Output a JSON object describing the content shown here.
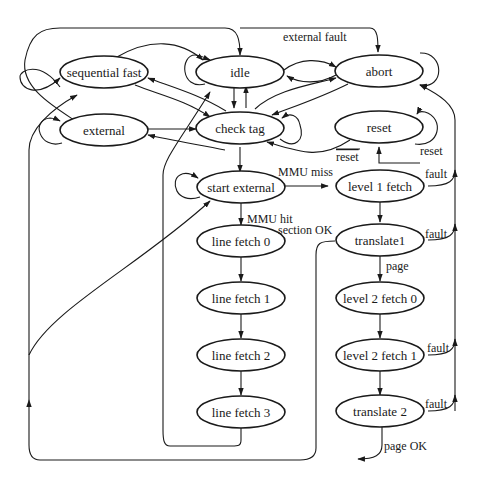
{
  "diagram": {
    "type": "state-machine",
    "colors": {
      "stroke": "#1a1a1a",
      "background": "#ffffff"
    },
    "nodes": [
      {
        "id": "sequential_fast",
        "label": "sequential fast"
      },
      {
        "id": "idle",
        "label": "idle"
      },
      {
        "id": "abort",
        "label": "abort"
      },
      {
        "id": "external",
        "label": "external"
      },
      {
        "id": "check_tag",
        "label": "check tag"
      },
      {
        "id": "reset",
        "label": "reset"
      },
      {
        "id": "start_external",
        "label": "start external"
      },
      {
        "id": "level_1_fetch",
        "label": "level 1 fetch"
      },
      {
        "id": "line_fetch_0",
        "label": "line fetch 0"
      },
      {
        "id": "translate1",
        "label": "translate1"
      },
      {
        "id": "line_fetch_1",
        "label": "line fetch 1"
      },
      {
        "id": "level_2_fetch_0",
        "label": "level 2 fetch 0"
      },
      {
        "id": "line_fetch_2",
        "label": "line fetch 2"
      },
      {
        "id": "level_2_fetch_1",
        "label": "level 2 fetch 1"
      },
      {
        "id": "line_fetch_3",
        "label": "line fetch 3"
      },
      {
        "id": "translate_2",
        "label": "translate 2"
      }
    ],
    "edge_labels": {
      "external_fault": "external fault",
      "reset_bar": "reset",
      "reset": "reset",
      "mmu_miss": "MMU miss",
      "mmu_hit": "MMU hit",
      "section_ok": "section OK",
      "fault_l1": "fault",
      "fault_t1": "fault",
      "page": "page",
      "fault_l2f1": "fault",
      "fault_t2": "fault",
      "page_ok": "page OK"
    },
    "edges": [
      {
        "from": "sequential_fast",
        "to": "sequential_fast",
        "label": ""
      },
      {
        "from": "idle",
        "to": "idle",
        "label": ""
      },
      {
        "from": "abort",
        "to": "abort",
        "label": ""
      },
      {
        "from": "external",
        "to": "external",
        "label": ""
      },
      {
        "from": "check_tag",
        "to": "check_tag",
        "label": ""
      },
      {
        "from": "reset",
        "to": "reset",
        "label": ""
      },
      {
        "from": "start_external",
        "to": "start_external",
        "label": ""
      },
      {
        "from": "idle",
        "to": "abort",
        "label": "external fault"
      },
      {
        "from": "idle",
        "to": "check_tag",
        "label": ""
      },
      {
        "from": "check_tag",
        "to": "idle",
        "label": ""
      },
      {
        "from": "check_tag",
        "to": "start_external",
        "label": ""
      },
      {
        "from": "start_external",
        "to": "level_1_fetch",
        "label": "MMU miss"
      },
      {
        "from": "start_external",
        "to": "line_fetch_0",
        "label": "MMU hit"
      },
      {
        "from": "level_1_fetch",
        "to": "translate1",
        "label": ""
      },
      {
        "from": "translate1",
        "to": "line_fetch_0",
        "label": "section OK"
      },
      {
        "from": "translate1",
        "to": "level_2_fetch_0",
        "label": "page"
      },
      {
        "from": "level_2_fetch_0",
        "to": "level_2_fetch_1",
        "label": ""
      },
      {
        "from": "level_2_fetch_1",
        "to": "translate_2",
        "label": ""
      },
      {
        "from": "level_1_fetch",
        "to": "abort",
        "label": "fault"
      },
      {
        "from": "translate1",
        "to": "abort",
        "label": "fault"
      },
      {
        "from": "level_2_fetch_1",
        "to": "abort",
        "label": "fault"
      },
      {
        "from": "translate_2",
        "to": "abort",
        "label": "fault"
      },
      {
        "from": "translate_2",
        "to": "line_fetch_0",
        "label": "page OK"
      },
      {
        "from": "line_fetch_0",
        "to": "line_fetch_1",
        "label": ""
      },
      {
        "from": "line_fetch_1",
        "to": "line_fetch_2",
        "label": ""
      },
      {
        "from": "line_fetch_2",
        "to": "line_fetch_3",
        "label": ""
      },
      {
        "from": "line_fetch_3",
        "to": "idle",
        "label": ""
      },
      {
        "from": "reset",
        "to": "check_tag",
        "label": "reset"
      },
      {
        "from": "external",
        "to": "check_tag",
        "label": ""
      },
      {
        "from": "check_tag",
        "to": "external",
        "label": ""
      },
      {
        "from": "sequential_fast",
        "to": "idle",
        "label": ""
      },
      {
        "from": "sequential_fast",
        "to": "check_tag",
        "label": ""
      },
      {
        "from": "check_tag",
        "to": "sequential_fast",
        "label": ""
      },
      {
        "from": "abort",
        "to": "idle",
        "label": ""
      },
      {
        "from": "check_tag",
        "to": "abort",
        "label": ""
      },
      {
        "from": "abort",
        "to": "check_tag",
        "label": ""
      }
    ]
  }
}
